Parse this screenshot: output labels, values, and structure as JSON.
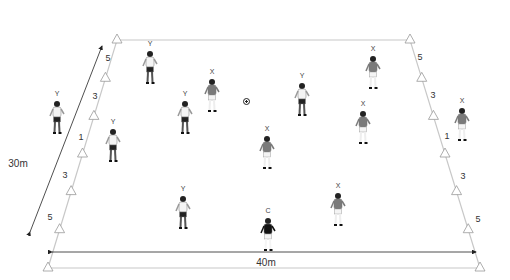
{
  "diagram": {
    "type": "soccer-drill-field",
    "field": {
      "width_label": "40m",
      "depth_label": "30m",
      "line_color": "#bbbbbb",
      "corners": {
        "top_left": [
          117,
          40
        ],
        "top_right": [
          410,
          40
        ],
        "bottom_left": [
          48,
          268
        ],
        "bottom_right": [
          480,
          268
        ]
      }
    },
    "zone_markers": {
      "left": [
        "5",
        "3",
        "1",
        "3",
        "5"
      ],
      "right": [
        "5",
        "3",
        "1",
        "3",
        "5"
      ]
    },
    "players": [
      {
        "team": "Y",
        "x": 150,
        "y": 50
      },
      {
        "team": "X",
        "x": 212,
        "y": 78
      },
      {
        "team": "Y",
        "x": 185,
        "y": 100
      },
      {
        "team": "Y",
        "x": 302,
        "y": 82
      },
      {
        "team": "X",
        "x": 373,
        "y": 55
      },
      {
        "team": "X",
        "x": 363,
        "y": 110
      },
      {
        "team": "X",
        "x": 462,
        "y": 107
      },
      {
        "team": "Y",
        "x": 57,
        "y": 100
      },
      {
        "team": "Y",
        "x": 113,
        "y": 128
      },
      {
        "team": "X",
        "x": 267,
        "y": 135
      },
      {
        "team": "Y",
        "x": 183,
        "y": 195
      },
      {
        "team": "X",
        "x": 338,
        "y": 192
      },
      {
        "team": "C",
        "x": 268,
        "y": 217
      }
    ],
    "ball": {
      "x": 246,
      "y": 101
    },
    "colors": {
      "x_shirt": "#7a7a7a",
      "y_shirt": "#f4f4f4",
      "shorts_dark": "#222222",
      "coach": "#111111"
    }
  }
}
